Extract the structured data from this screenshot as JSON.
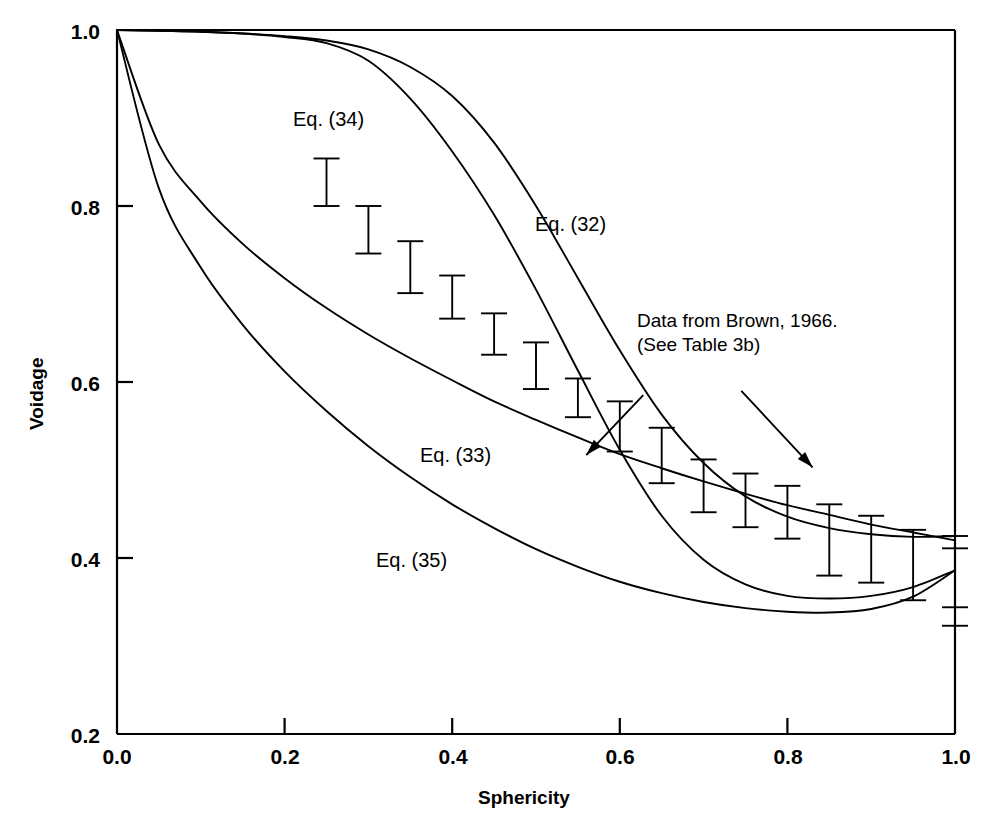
{
  "chart_data": {
    "type": "line",
    "title": "",
    "xlabel": "Sphericity",
    "ylabel": "Voidage",
    "xlim": [
      0.0,
      1.0
    ],
    "ylim": [
      0.2,
      1.0
    ],
    "xticks": [
      "0.0",
      "0.2",
      "0.4",
      "0.6",
      "0.8",
      "1.0"
    ],
    "xtick_values": [
      0.0,
      0.2,
      0.4,
      0.6,
      0.8,
      1.0
    ],
    "yticks": [
      "0.2",
      "0.4",
      "0.6",
      "0.8",
      "1.0"
    ],
    "ytick_values": [
      0.2,
      0.4,
      0.6,
      0.8,
      1.0
    ],
    "grid": false,
    "legend": "inline curve labels",
    "series": [
      {
        "name": "Eq. (32)",
        "label": "Eq. (32)",
        "label_x": 0.505,
        "label_y": 0.775,
        "x": [
          0.0,
          0.05,
          0.1,
          0.15,
          0.2,
          0.25,
          0.3,
          0.35,
          0.4,
          0.45,
          0.5,
          0.55,
          0.6,
          0.65,
          0.7,
          0.75,
          0.8,
          0.85,
          0.9,
          0.95,
          1.0
        ],
        "y": [
          1.0,
          0.999,
          0.998,
          0.996,
          0.993,
          0.988,
          0.978,
          0.958,
          0.925,
          0.872,
          0.8,
          0.718,
          0.636,
          0.563,
          0.508,
          0.47,
          0.447,
          0.434,
          0.427,
          0.424,
          0.425
        ]
      },
      {
        "name": "Eq. (34)",
        "label": "Eq. (34)",
        "label_x": 0.245,
        "label_y": 0.867,
        "x": [
          0.0,
          0.05,
          0.1,
          0.15,
          0.2,
          0.25,
          0.3,
          0.35,
          0.4,
          0.45,
          0.5,
          0.55,
          0.6,
          0.65,
          0.7,
          0.75,
          0.8,
          0.85,
          0.9,
          0.95,
          1.0
        ],
        "y": [
          1.0,
          0.999,
          0.998,
          0.996,
          0.992,
          0.985,
          0.965,
          0.922,
          0.862,
          0.79,
          0.705,
          0.613,
          0.523,
          0.448,
          0.398,
          0.37,
          0.357,
          0.354,
          0.357,
          0.367,
          0.386
        ]
      },
      {
        "name": "Eq. (33)",
        "label": "Eq. (33)",
        "label_x": 0.405,
        "label_y": 0.512,
        "x": [
          0.0,
          0.05,
          0.1,
          0.15,
          0.2,
          0.25,
          0.3,
          0.35,
          0.4,
          0.45,
          0.5,
          0.55,
          0.6,
          0.65,
          0.7,
          0.75,
          0.8,
          0.85,
          0.9,
          0.95,
          1.0
        ],
        "y": [
          1.0,
          0.87,
          0.805,
          0.757,
          0.718,
          0.684,
          0.654,
          0.627,
          0.602,
          0.578,
          0.557,
          0.537,
          0.518,
          0.502,
          0.487,
          0.473,
          0.46,
          0.449,
          0.438,
          0.429,
          0.42
        ]
      },
      {
        "name": "Eq. (35)",
        "label": "Eq. (35)",
        "label_x": 0.315,
        "label_y": 0.393,
        "x": [
          0.0,
          0.05,
          0.1,
          0.15,
          0.2,
          0.25,
          0.3,
          0.35,
          0.4,
          0.45,
          0.5,
          0.55,
          0.6,
          0.65,
          0.7,
          0.75,
          0.8,
          0.85,
          0.9,
          0.95,
          1.0
        ],
        "y": [
          1.0,
          0.82,
          0.73,
          0.665,
          0.612,
          0.567,
          0.527,
          0.492,
          0.461,
          0.434,
          0.41,
          0.39,
          0.373,
          0.36,
          0.35,
          0.343,
          0.339,
          0.338,
          0.342,
          0.356,
          0.386
        ]
      }
    ],
    "errorbars": {
      "name": "Data from Brown, 1966.",
      "x": [
        0.25,
        0.3,
        0.35,
        0.4,
        0.45,
        0.5,
        0.55,
        0.6,
        0.65,
        0.7,
        0.75,
        0.8,
        0.85,
        0.9,
        0.95,
        1.0,
        1.0
      ],
      "ylow": [
        0.8,
        0.746,
        0.701,
        0.672,
        0.631,
        0.592,
        0.56,
        0.521,
        0.485,
        0.452,
        0.435,
        0.422,
        0.38,
        0.372,
        0.352,
        0.323,
        0.411
      ],
      "yhigh": [
        0.854,
        0.8,
        0.76,
        0.721,
        0.678,
        0.645,
        0.604,
        0.578,
        0.548,
        0.512,
        0.496,
        0.482,
        0.461,
        0.448,
        0.432,
        0.344,
        0.425
      ]
    },
    "annotations": [
      {
        "name": "data-source-note",
        "lines": [
          "Data from Brown, 1966.",
          "(See Table 3b)"
        ],
        "text_x": 0.615,
        "text_y": 0.625,
        "arrows": [
          {
            "from_x": 0.628,
            "from_y": 0.585,
            "to_x": 0.56,
            "to_y": 0.517
          },
          {
            "from_x": 0.745,
            "from_y": 0.59,
            "to_x": 0.83,
            "to_y": 0.503
          }
        ]
      }
    ]
  },
  "axes": {
    "x_title": "Sphericity",
    "y_title": "Voidage",
    "x_tick_labels": [
      "0.0",
      "0.2",
      "0.4",
      "0.6",
      "0.8",
      "1.0"
    ],
    "y_tick_labels": [
      "1.0",
      "0.8",
      "0.6",
      "0.4",
      "0.2"
    ]
  },
  "labels": {
    "eq32": "Eq. (32)",
    "eq33": "Eq. (33)",
    "eq34": "Eq. (34)",
    "eq35": "Eq. (35)",
    "note_line1": "Data from Brown, 1966.",
    "note_line2": "(See Table 3b)"
  },
  "colors": {
    "ink": "#000000",
    "background": "#ffffff"
  }
}
